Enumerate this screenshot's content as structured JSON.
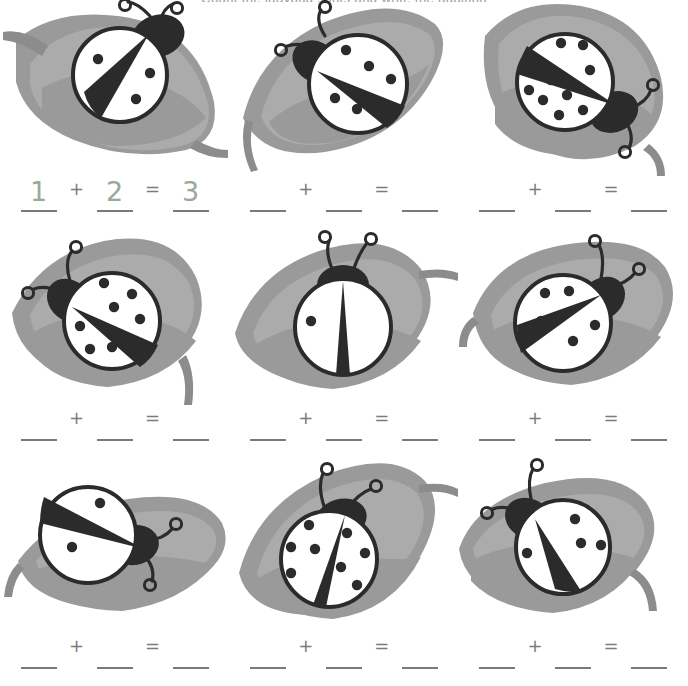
{
  "page": {
    "title_fragment": "Count the ladybug spots and write the addition",
    "background_color": "#ffffff",
    "width": 688,
    "height": 686
  },
  "colors": {
    "leaf": "#9a9a9a",
    "leaf_shadow": "#8c8c8c",
    "leaf_highlight": "#ababab",
    "ink": "#2b2b2b",
    "body": "#ffffff",
    "rule": "#7a7a7a",
    "operator": "#7c7c7c",
    "answer_ink": "#9aa89a"
  },
  "equation": {
    "plus_label": "+",
    "equals_label": "=",
    "blank_label": ""
  },
  "problems": [
    {
      "id": "problem-1",
      "filled": true,
      "left_spots": 1,
      "right_spots": 2,
      "sum": 3,
      "addend_a": "1",
      "addend_b": "2",
      "result": "3",
      "bug": {
        "leaf": "leaf-left-tip-down",
        "split": "diagonal-steep",
        "rotation": -4
      }
    },
    {
      "id": "problem-2",
      "filled": false,
      "left_spots": 3,
      "right_spots": 2,
      "sum": 5,
      "addend_a": "",
      "addend_b": "",
      "result": "",
      "bug": {
        "leaf": "leaf-pointed-left",
        "split": "diagonal-shallow",
        "rotation": -22
      }
    },
    {
      "id": "problem-3",
      "filled": false,
      "left_spots": 3,
      "right_spots": 7,
      "sum": 10,
      "addend_a": "",
      "addend_b": "",
      "result": "",
      "bug": {
        "leaf": "leaf-tip-right",
        "split": "diagonal-shallow-flip",
        "rotation": 205
      }
    },
    {
      "id": "problem-4",
      "filled": false,
      "left_spots": 4,
      "right_spots": 3,
      "sum": 7,
      "addend_a": "",
      "addend_b": "",
      "result": "",
      "bug": {
        "leaf": "leaf-pointed-right",
        "split": "diagonal-shallow",
        "rotation": -18
      }
    },
    {
      "id": "problem-5",
      "filled": false,
      "left_spots": 1,
      "right_spots": 0,
      "sum": 1,
      "addend_a": "",
      "addend_b": "",
      "result": "",
      "bug": {
        "leaf": "leaf-wide-right-stem",
        "split": "vertical-narrow",
        "rotation": 0
      }
    },
    {
      "id": "problem-6",
      "filled": false,
      "left_spots": 3,
      "right_spots": 2,
      "sum": 5,
      "addend_a": "",
      "addend_b": "",
      "result": "",
      "bug": {
        "leaf": "leaf-oval-left-stem",
        "split": "diagonal-steep",
        "rotation": 12
      }
    },
    {
      "id": "problem-7",
      "filled": false,
      "left_spots": 1,
      "right_spots": 1,
      "sum": 2,
      "addend_a": "",
      "addend_b": "",
      "result": "",
      "bug": {
        "leaf": "leaf-horizontal",
        "split": "diagonal-shallow-flip",
        "rotation": 160
      }
    },
    {
      "id": "problem-8",
      "filled": false,
      "left_spots": 4,
      "right_spots": 4,
      "sum": 8,
      "addend_a": "",
      "addend_b": "",
      "result": "",
      "bug": {
        "leaf": "leaf-curved-down",
        "split": "vertical-wedge",
        "rotation": 6
      }
    },
    {
      "id": "problem-9",
      "filled": false,
      "left_spots": 1,
      "right_spots": 3,
      "sum": 4,
      "addend_a": "",
      "addend_b": "",
      "result": "",
      "bug": {
        "leaf": "leaf-rounded-stem-right",
        "split": "diagonal-steep",
        "rotation": -8
      }
    }
  ]
}
